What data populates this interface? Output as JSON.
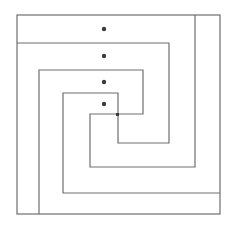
{
  "diagram": {
    "title": "",
    "stroke_color": "#6e6e6e",
    "dot_color": "#3a3a3a",
    "outer_frame": {
      "x1": 17,
      "y1": 15,
      "x2": 220,
      "y2": 214
    },
    "path_a": "M17,43 L169,43 L169,143 L118,143 L118,93 L63,93 L63,193 L220,193",
    "path_b": "M195,15 L195,167 L90,167 L90,114 L143,114 L143,70 L39,70 L39,214",
    "dots": [
      {
        "cx": 104,
        "cy": 29
      },
      {
        "cx": 104,
        "cy": 56
      },
      {
        "cx": 104,
        "cy": 82
      },
      {
        "cx": 104,
        "cy": 104
      }
    ],
    "junction": {
      "x": 116,
      "y": 113,
      "size": 3
    }
  }
}
